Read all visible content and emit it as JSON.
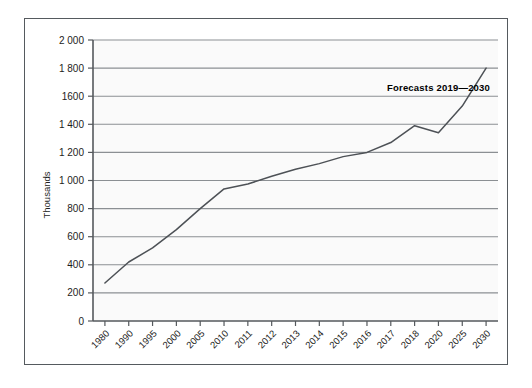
{
  "chart_data": {
    "type": "line",
    "title": "",
    "subtitle": "",
    "xlabel": "",
    "ylabel": "Thousands",
    "ylim": [
      0,
      2000
    ],
    "ytick_step": 200,
    "grid": true,
    "legend": "none",
    "categories": [
      "1980",
      "1990",
      "1995",
      "2000",
      "2005",
      "2010",
      "2011",
      "2012",
      "2013",
      "2014",
      "2015",
      "2016",
      "2017",
      "2018",
      "2020",
      "2025",
      "2030"
    ],
    "values": [
      270,
      420,
      520,
      650,
      800,
      940,
      975,
      1030,
      1080,
      1120,
      1170,
      1200,
      1270,
      1390,
      1340,
      1530,
      1800
    ],
    "ytick_labels": [
      "2 000",
      "1 800",
      "1600",
      "1 400",
      "1 200",
      "1 000",
      "800",
      "600",
      "400",
      "200",
      "0"
    ],
    "ytick_values": [
      2000,
      1800,
      1600,
      1400,
      1200,
      1000,
      800,
      600,
      400,
      200,
      0
    ],
    "annotations": [
      {
        "text": "Forecasts 2019—2030",
        "x_category": "2030",
        "y_value": 1640
      }
    ],
    "series_color": "#4d5156",
    "grid_color": "#8b8f93",
    "axis_color": "#55595d",
    "plot_background": "#fafafa",
    "frame_border_color": "#555a5e"
  }
}
